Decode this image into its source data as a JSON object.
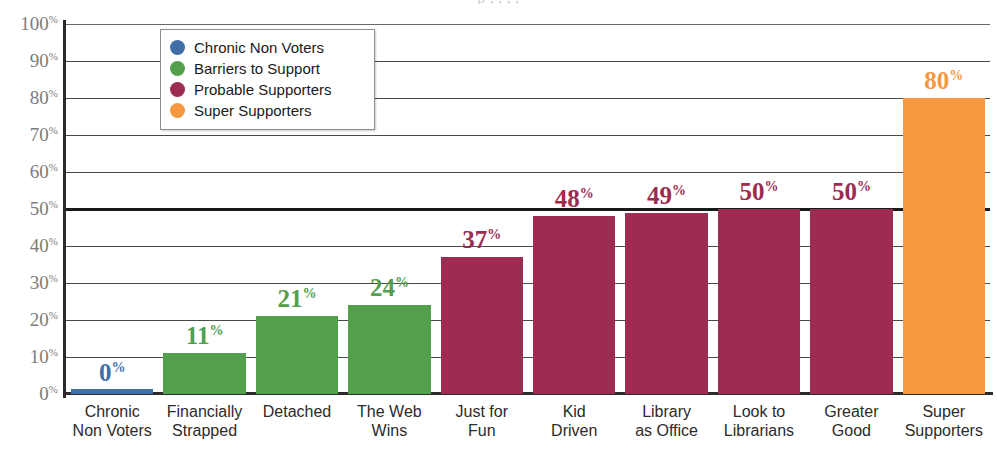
{
  "top_fragment": "p                    ,                 ,              ,              ,",
  "legend": {
    "items": [
      {
        "label": "Chronic Non Voters",
        "color": "#3f6fa6"
      },
      {
        "label": "Barriers to Support",
        "color": "#52a04c"
      },
      {
        "label": "Probable Supporters",
        "color": "#9c2c50"
      },
      {
        "label": "Super Supporters",
        "color": "#f5983f"
      }
    ]
  },
  "axis": {
    "y_ticks": [
      "100",
      "90",
      "80",
      "70",
      "60",
      "50",
      "40",
      "30",
      "20",
      "10",
      "0"
    ],
    "percent_sign": "%"
  },
  "chart_data": {
    "type": "bar",
    "title": "",
    "xlabel": "",
    "ylabel": "",
    "ylim": [
      0,
      100
    ],
    "ytick_values": [
      0,
      10,
      20,
      30,
      40,
      50,
      60,
      70,
      80,
      90,
      100
    ],
    "ytick_labels": [
      "0%",
      "10%",
      "20%",
      "30%",
      "40%",
      "50%",
      "60%",
      "70%",
      "80%",
      "90%",
      "100%"
    ],
    "grid": true,
    "emphasized_gridline": 50,
    "legend_position": "upper-left-inside",
    "categories": [
      "Chronic Non Voters",
      "Financially Strapped",
      "Detached",
      "The Web Wins",
      "Just for Fun",
      "Kid Driven",
      "Library as Office",
      "Look to Librarians",
      "Greater Good",
      "Super Supporters"
    ],
    "category_lines": [
      [
        "Chronic",
        "Non Voters"
      ],
      [
        "Financially",
        "Strapped"
      ],
      [
        "Detached",
        ""
      ],
      [
        "The Web",
        "Wins"
      ],
      [
        "Just for",
        "Fun"
      ],
      [
        "Kid",
        "Driven"
      ],
      [
        "Library",
        "as Office"
      ],
      [
        "Look to",
        "Librarians"
      ],
      [
        "Greater",
        "Good"
      ],
      [
        "Super",
        "Supporters"
      ]
    ],
    "values": [
      0,
      11,
      21,
      24,
      37,
      48,
      49,
      50,
      50,
      80
    ],
    "value_labels": [
      "0%",
      "11%",
      "21%",
      "24%",
      "37%",
      "48%",
      "49%",
      "50%",
      "50%",
      "80%"
    ],
    "series_groups": [
      "Chronic Non Voters",
      "Barriers to Support",
      "Barriers to Support",
      "Barriers to Support",
      "Probable Supporters",
      "Probable Supporters",
      "Probable Supporters",
      "Probable Supporters",
      "Probable Supporters",
      "Super Supporters"
    ],
    "bar_colors": [
      "#3f6fa6",
      "#52a04c",
      "#52a04c",
      "#52a04c",
      "#9c2c50",
      "#9c2c50",
      "#9c2c50",
      "#9c2c50",
      "#9c2c50",
      "#f5983f"
    ],
    "label_colors": [
      "#3f6fa6",
      "#52a04c",
      "#52a04c",
      "#52a04c",
      "#9c2c50",
      "#9c2c50",
      "#9c2c50",
      "#9c2c50",
      "#9c2c50",
      "#f5983f"
    ]
  }
}
